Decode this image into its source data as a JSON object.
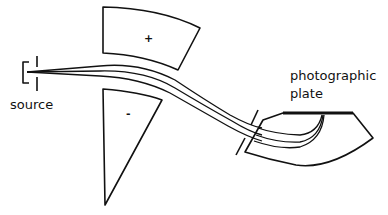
{
  "diagram": {
    "labels": {
      "source": "source",
      "plate_line1": "photographic",
      "plate_line2": "plate",
      "plus_plate": "+",
      "minus_plate": "-"
    },
    "components": [
      "ion source with slits",
      "positive electrostatic plate",
      "negative electrostatic plate",
      "ion beam paths (3)",
      "slit",
      "magnetic sector",
      "photographic plate"
    ],
    "colors": {
      "ink": "#111111",
      "background": "#ffffff"
    }
  }
}
